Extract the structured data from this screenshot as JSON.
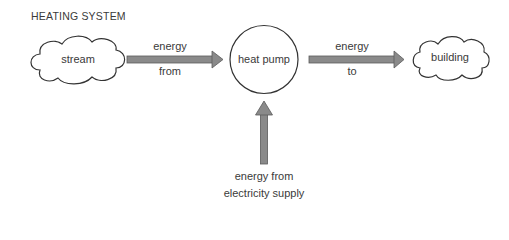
{
  "title": "HEATING SYSTEM",
  "nodes": {
    "source": {
      "label": "stream",
      "shape": "cloud"
    },
    "center": {
      "label": "heat pump",
      "shape": "circle"
    },
    "target": {
      "label": "building",
      "shape": "cloud"
    }
  },
  "arrows": {
    "in_left": {
      "line1": "energy",
      "line2": "from"
    },
    "out_right": {
      "line1": "energy",
      "line2": "to"
    },
    "in_bottom": {
      "line1": "energy from",
      "line2": "electricity supply"
    }
  },
  "colors": {
    "arrow_fill": "#8a8a8a",
    "arrow_stroke": "#5a5a5a",
    "outline": "#333333"
  }
}
